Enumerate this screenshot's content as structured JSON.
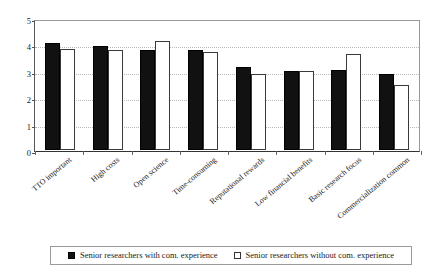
{
  "chart_data": {
    "type": "bar",
    "title": "",
    "xlabel": "",
    "ylabel": "",
    "ylim": [
      0,
      5
    ],
    "yticks": [
      0,
      1,
      2,
      3,
      4,
      5
    ],
    "grid": true,
    "legend_position": "bottom",
    "categories": [
      "TTO important",
      "High costs",
      "Open science",
      "Time-consuming",
      "Reputational rewards",
      "Low financial benefits",
      "Basic research focus",
      "Commercialization common"
    ],
    "series": [
      {
        "name": "Senior researchers with com. experience",
        "color": "#111111",
        "values": [
          4.05,
          3.95,
          3.8,
          3.8,
          3.15,
          3.0,
          3.02,
          2.88
        ]
      },
      {
        "name": "Senior researchers without com. experience",
        "color": "#ffffff",
        "values": [
          3.82,
          3.78,
          4.12,
          3.72,
          2.88,
          3.0,
          3.65,
          2.45
        ]
      }
    ]
  },
  "legend": {
    "entries": [
      {
        "label": "Senior researchers with com. experience",
        "swatch": "filled-square-black"
      },
      {
        "label": "Senior researchers without com. experience",
        "swatch": "open-square-white"
      }
    ]
  }
}
